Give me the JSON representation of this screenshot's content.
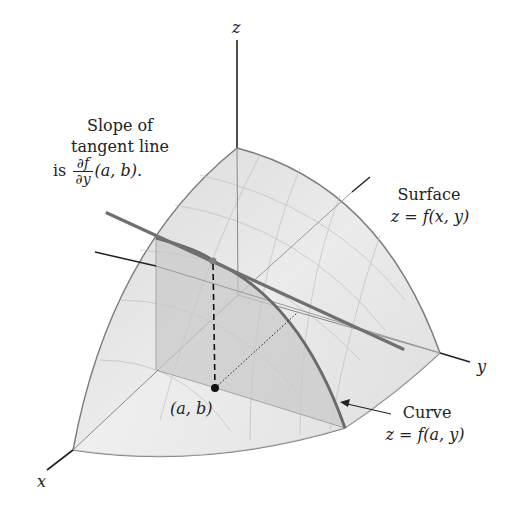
{
  "figure": {
    "axes": {
      "x_label": "x",
      "y_label": "y",
      "z_label": "z"
    },
    "annotations": {
      "slope": {
        "line1": "Slope of",
        "line2": "tangent line",
        "prefix": "is",
        "frac_num": "∂f",
        "frac_den": "∂y",
        "suffix": "(a, b)."
      },
      "surface": {
        "line1": "Surface",
        "line2": "z = f(x, y)"
      },
      "curve": {
        "line1": "Curve",
        "line2": "z = f(a, y)"
      },
      "point": "(a, b)"
    },
    "colors": {
      "surface_fill": "#e4e4e4",
      "surface_edge": "#7a7a7a",
      "plane_fill": "#cfcfcf",
      "tangent_line": "#707070",
      "curve": "#6a6a6a",
      "axis": "#222222",
      "point": "#111111"
    }
  }
}
